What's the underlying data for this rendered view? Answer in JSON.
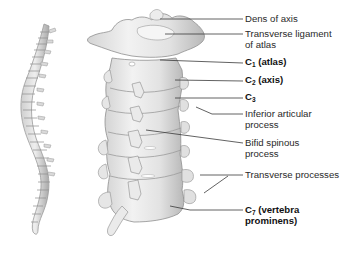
{
  "figure": {
    "type": "anatomical-diagram",
    "colors": {
      "background": "#ffffff",
      "bone": "#e6e6e6",
      "bone_shadow": "#a8a8a8",
      "leader_line": "#3a3a3a",
      "text": "#2a2a2a"
    }
  },
  "labels": [
    {
      "id": "dens",
      "text": "Dens of axis",
      "bold": false,
      "line2": ""
    },
    {
      "id": "transverse-ligament",
      "text": "Transverse ligament",
      "bold": false,
      "line2": "of atlas"
    },
    {
      "id": "c1",
      "prefix": "C",
      "sub": "1",
      "text": " (atlas)",
      "bold": true,
      "line2": ""
    },
    {
      "id": "c2",
      "prefix": "C",
      "sub": "2",
      "text": " (axis)",
      "bold": true,
      "line2": ""
    },
    {
      "id": "c3",
      "prefix": "C",
      "sub": "3",
      "text": "",
      "bold": true,
      "line2": ""
    },
    {
      "id": "inferior-articular",
      "text": "Inferior articular",
      "bold": false,
      "line2": "process"
    },
    {
      "id": "bifid-spinous",
      "text": "Bifid spinous",
      "bold": false,
      "line2": "process"
    },
    {
      "id": "transverse-processes",
      "text": "Transverse processes",
      "bold": false,
      "line2": ""
    },
    {
      "id": "c7",
      "prefix": "C",
      "sub": "7",
      "text": " (vertebra",
      "bold": true,
      "line2": "prominens)"
    }
  ]
}
